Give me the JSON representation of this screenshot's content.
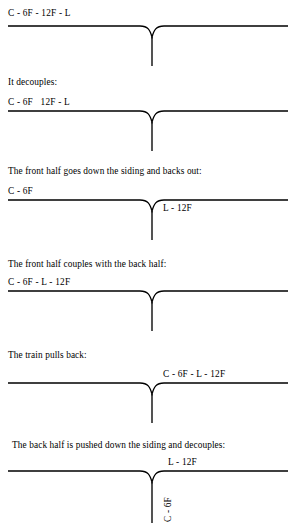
{
  "document": {
    "type": "railway-shunting-puzzle-diagram",
    "line_color": "#000000",
    "background_color": "#ffffff",
    "font_style": "serif"
  },
  "sections": [
    {
      "id": "step-1",
      "caption": "",
      "train_label": "C - 6F - 12F - L",
      "train_label_align": "left",
      "siding_label": "",
      "siding_label_vertical": false,
      "has_junction": true
    },
    {
      "id": "step-2",
      "caption": "It decouples:",
      "train_label": "C - 6F   12F - L",
      "train_label_align": "left",
      "siding_label": "",
      "siding_label_vertical": false,
      "has_junction": true
    },
    {
      "id": "step-3",
      "caption": "The front half goes down the siding and backs out:",
      "train_label": "C - 6F",
      "train_label_align": "left",
      "siding_label": "L - 12F",
      "siding_label_vertical": false,
      "has_junction": true
    },
    {
      "id": "step-4",
      "caption": "The front half couples with the back half:",
      "train_label": "C - 6F - L - 12F",
      "train_label_align": "left",
      "siding_label": "",
      "siding_label_vertical": false,
      "has_junction": true
    },
    {
      "id": "step-5",
      "caption": "The train pulls back:",
      "train_label": "C - 6F - L - 12F",
      "train_label_align": "right",
      "siding_label": "",
      "siding_label_vertical": false,
      "has_junction": true
    },
    {
      "id": "step-6",
      "caption": "The back half is pushed down the siding and decouples:",
      "train_label": "L - 12F",
      "train_label_align": "center",
      "siding_label": "C - 6F",
      "siding_label_vertical": true,
      "has_junction": true
    }
  ]
}
